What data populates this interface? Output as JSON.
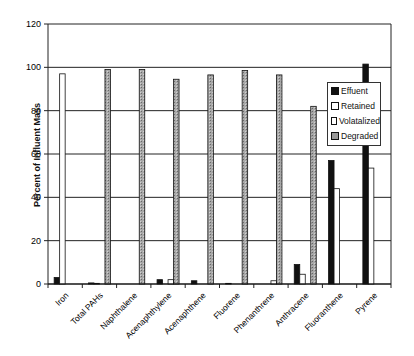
{
  "chart_data": {
    "type": "bar",
    "title": "",
    "xlabel": "",
    "ylabel": "Percent of Influent Mass",
    "ylim": [
      0,
      120
    ],
    "yticks": [
      0,
      20,
      40,
      60,
      80,
      100,
      120
    ],
    "grid": true,
    "legend_position": "right-inside",
    "categories": [
      "Iron",
      "Total PAHs",
      "Naphthalene",
      "Acenaphthylene",
      "Acenaphthene",
      "Fluorene",
      "Phenanthrene",
      "Anthracene",
      "Fluoranthene",
      "Pyrene"
    ],
    "series": [
      {
        "name": "Effuent",
        "color": "#111111",
        "values": [
          3,
          0.5,
          0,
          2,
          1.5,
          0.3,
          0,
          9,
          57,
          101.5
        ]
      },
      {
        "name": "Retained",
        "color": "#ffffff",
        "values": [
          97,
          0.3,
          0,
          0,
          0,
          0,
          0,
          4.5,
          44,
          53.5
        ]
      },
      {
        "name": "Volatalized",
        "color": "#ffffff",
        "values": [
          0,
          0,
          0,
          2,
          0,
          0,
          1.5,
          0,
          0,
          0
        ]
      },
      {
        "name": "Degraded",
        "color": "#9a9a9a",
        "values": [
          0,
          99,
          99,
          94.5,
          96.5,
          98.5,
          96.5,
          82,
          0,
          0
        ]
      }
    ]
  }
}
